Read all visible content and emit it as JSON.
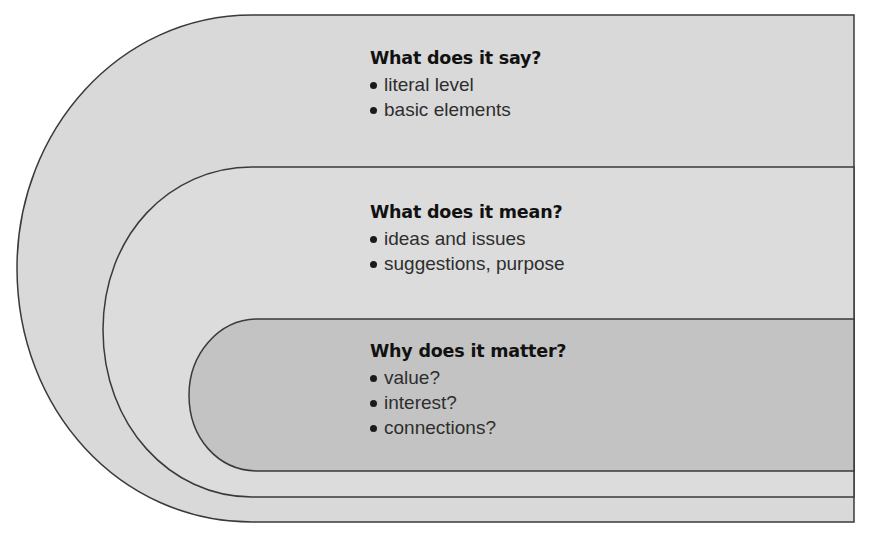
{
  "diagram": {
    "type": "nested-levels",
    "colors": {
      "outer_fill": "#d9d9d9",
      "middle_fill": "#dcdcdc",
      "inner_fill": "#c3c3c3",
      "stroke": "#3a3a3a"
    },
    "layers": [
      {
        "id": "outer",
        "heading": "What does it say?",
        "bullets": [
          "literal level",
          "basic elements"
        ]
      },
      {
        "id": "middle",
        "heading": "What does it mean?",
        "bullets": [
          "ideas and issues",
          "suggestions, purpose"
        ]
      },
      {
        "id": "inner",
        "heading": "Why does it matter?",
        "bullets": [
          "value?",
          "interest?",
          "connections?"
        ]
      }
    ]
  }
}
